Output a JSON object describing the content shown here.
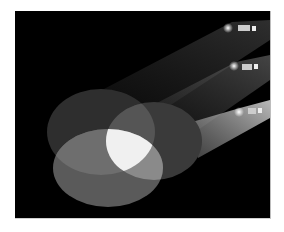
{
  "scene": {
    "description": "Three spotlights casting overlapping elliptical pools of light on a black background",
    "background_color": "#000000",
    "page_color": "#ffffff",
    "spotlights": [
      {
        "name": "spotlight-top",
        "x": 244,
        "y": 29
      },
      {
        "name": "spotlight-middle",
        "x": 243,
        "y": 67
      },
      {
        "name": "spotlight-bottom",
        "x": 243,
        "y": 112
      }
    ],
    "pools": [
      {
        "name": "pool-top-left",
        "cx": 101,
        "cy": 132,
        "rx": 54,
        "ry": 43,
        "color": "#2e2e2e"
      },
      {
        "name": "pool-right",
        "cx": 154,
        "cy": 141,
        "rx": 48,
        "ry": 39,
        "color": "#3a3a3a"
      },
      {
        "name": "pool-bottom",
        "cx": 108,
        "cy": 168,
        "rx": 55,
        "ry": 39,
        "color": "#555555"
      }
    ],
    "overlap_color": "#f0f0f0"
  }
}
